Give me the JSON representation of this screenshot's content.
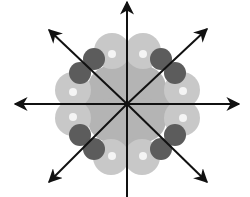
{
  "diagram": {
    "center": {
      "x": 127,
      "y": 104
    },
    "colors": {
      "background": "#ffffff",
      "core_fill": "#b4b4b4",
      "light_lobe": "#c8c8c8",
      "dark_lobe": "#5c5c5c",
      "highlight": "#f4f4f4",
      "arrow": "#111111"
    },
    "core_blobs": [
      {
        "cx": 127,
        "cy": 104,
        "r": 44
      },
      {
        "cx": 110,
        "cy": 88,
        "r": 22
      },
      {
        "cx": 144,
        "cy": 88,
        "r": 22
      },
      {
        "cx": 110,
        "cy": 120,
        "r": 22
      },
      {
        "cx": 144,
        "cy": 120,
        "r": 22
      }
    ],
    "light_lobes": [
      {
        "name": "top-left",
        "cx": 112,
        "cy": 51,
        "r": 18,
        "hx": 112,
        "hy": 54
      },
      {
        "name": "top-right",
        "cx": 143,
        "cy": 51,
        "r": 18,
        "hx": 143,
        "hy": 54
      },
      {
        "name": "left-top",
        "cx": 73,
        "cy": 90,
        "r": 18,
        "hx": 73,
        "hy": 92
      },
      {
        "name": "left-bottom",
        "cx": 73,
        "cy": 118,
        "r": 18,
        "hx": 73,
        "hy": 117
      },
      {
        "name": "right-top",
        "cx": 182,
        "cy": 90,
        "r": 18,
        "hx": 183,
        "hy": 91
      },
      {
        "name": "right-bottom",
        "cx": 182,
        "cy": 118,
        "r": 18,
        "hx": 183,
        "hy": 118
      },
      {
        "name": "bottom-left",
        "cx": 111,
        "cy": 157,
        "r": 18,
        "hx": 112,
        "hy": 156
      },
      {
        "name": "bottom-right",
        "cx": 142,
        "cy": 157,
        "r": 18,
        "hx": 143,
        "hy": 156
      }
    ],
    "dark_lobes": [
      {
        "name": "ul-outer",
        "cx": 94,
        "cy": 59,
        "r": 11
      },
      {
        "name": "ul-inner",
        "cx": 80,
        "cy": 73,
        "r": 11
      },
      {
        "name": "ur-outer",
        "cx": 161,
        "cy": 59,
        "r": 11
      },
      {
        "name": "ur-inner",
        "cx": 175,
        "cy": 73,
        "r": 11
      },
      {
        "name": "ll-outer",
        "cx": 80,
        "cy": 135,
        "r": 11
      },
      {
        "name": "ll-inner",
        "cx": 94,
        "cy": 149,
        "r": 11
      },
      {
        "name": "lr-outer",
        "cx": 175,
        "cy": 135,
        "r": 11
      },
      {
        "name": "lr-inner",
        "cx": 161,
        "cy": 149,
        "r": 11
      }
    ],
    "axes": [
      {
        "name": "up",
        "x1": 127,
        "y1": 197,
        "x2": 127,
        "y2": 2,
        "arrow_end": true
      },
      {
        "name": "left",
        "x1": 127,
        "y1": 104,
        "x2": 15,
        "y2": 104,
        "arrow_end": true
      },
      {
        "name": "right",
        "x1": 127,
        "y1": 104,
        "x2": 239,
        "y2": 104,
        "arrow_end": true
      },
      {
        "name": "upper-left",
        "x1": 127,
        "y1": 104,
        "x2": 49,
        "y2": 30,
        "arrow_end": true
      },
      {
        "name": "upper-right",
        "x1": 127,
        "y1": 104,
        "x2": 207,
        "y2": 29,
        "arrow_end": true
      },
      {
        "name": "lower-left",
        "x1": 127,
        "y1": 104,
        "x2": 49,
        "y2": 182,
        "arrow_end": true
      },
      {
        "name": "lower-right",
        "x1": 127,
        "y1": 104,
        "x2": 207,
        "y2": 182,
        "arrow_end": true
      }
    ]
  }
}
